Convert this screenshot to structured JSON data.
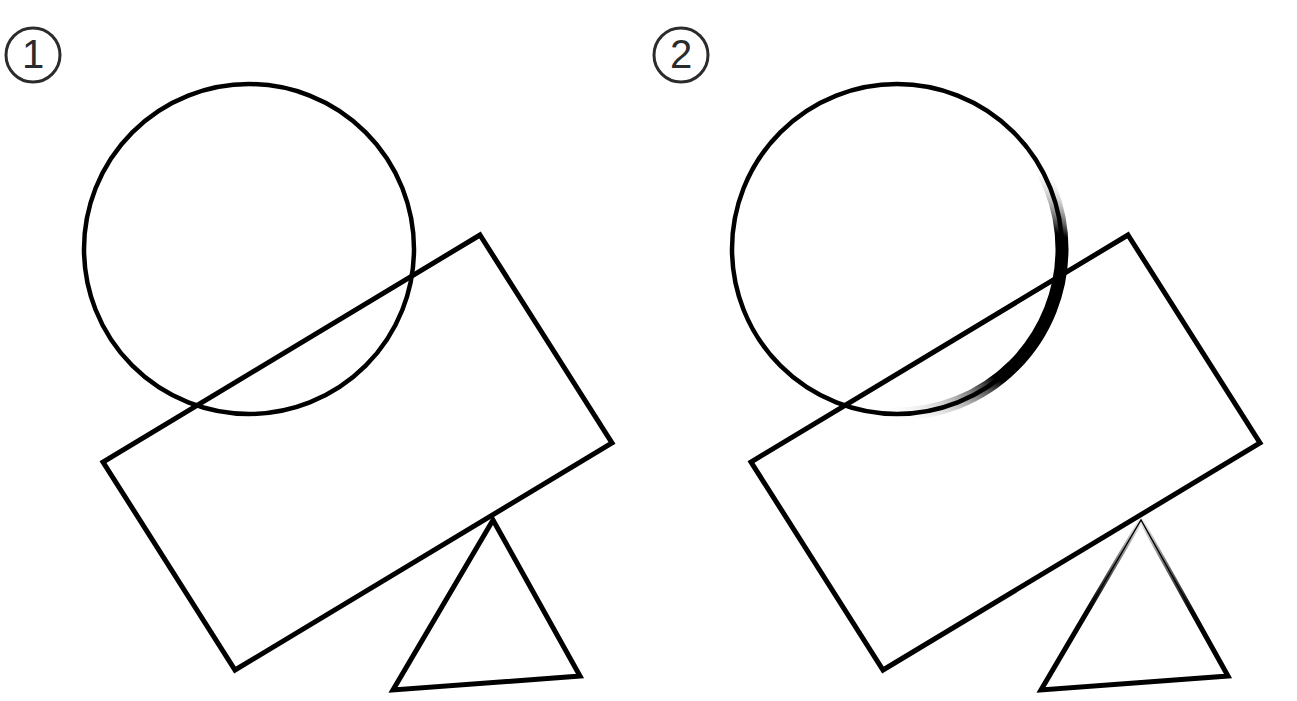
{
  "image": {
    "title": "Two-panel geometric line-drawing comparison",
    "background_color": "#ffffff",
    "stroke_color": "#000000",
    "width": 1297,
    "height": 701
  },
  "panels": [
    {
      "id": "panel-1",
      "badge_label": "1",
      "badge": {
        "cx": 33,
        "cy": 55,
        "r": 27,
        "stroke_width": 3,
        "color": "#2b2b2b"
      },
      "shapes": {
        "circle": {
          "name": "circle",
          "cx": 249,
          "cy": 249,
          "r": 165,
          "stroke_width": 4,
          "emphasis": "uniform"
        },
        "rectangle": {
          "name": "rotated-rectangle",
          "points": "480,235 612,443 235,670 103,462",
          "stroke_width": 5,
          "emphasis": "uniform"
        },
        "triangle": {
          "name": "triangle",
          "points": "493,520 580,676 393,690",
          "stroke_width": 5,
          "emphasis": "uniform"
        }
      }
    },
    {
      "id": "panel-2",
      "badge_label": "2",
      "badge": {
        "cx": 33,
        "cy": 55,
        "r": 27,
        "stroke_width": 3,
        "color": "#2b2b2b"
      },
      "shapes": {
        "circle": {
          "name": "circle",
          "cx": 249,
          "cy": 249,
          "r": 165,
          "stroke_width": 4,
          "emphasis": "thickened-right-lower-arc",
          "emphasis_stroke_width": 13
        },
        "rectangle": {
          "name": "rotated-rectangle",
          "points": "480,235 612,443 235,670 103,462",
          "stroke_width": 5,
          "emphasis": "uniform"
        },
        "triangle": {
          "name": "triangle",
          "points": "493,520 580,676 393,690",
          "stroke_width": 5,
          "emphasis": "tapered-apex-edges",
          "emphasis_stroke_width": 1.2
        }
      }
    }
  ]
}
